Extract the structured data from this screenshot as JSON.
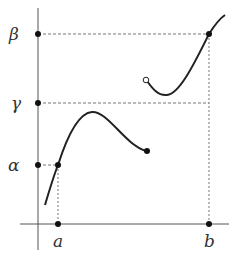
{
  "diagram": {
    "y_labels": {
      "beta": "β",
      "gamma": "γ",
      "alpha": "α"
    },
    "x_labels": {
      "a": "a",
      "b": "b"
    },
    "colors": {
      "axis": "#555555",
      "curve": "#222222",
      "dashed": "#777777",
      "text": "#333333"
    },
    "points": {
      "f_a": {
        "x": "a",
        "y": "α",
        "filled": true
      },
      "f_b": {
        "x": "b",
        "y": "β",
        "filled": true
      },
      "left_branch_end": {
        "filled": true
      },
      "right_branch_start": {
        "filled": false
      }
    }
  }
}
